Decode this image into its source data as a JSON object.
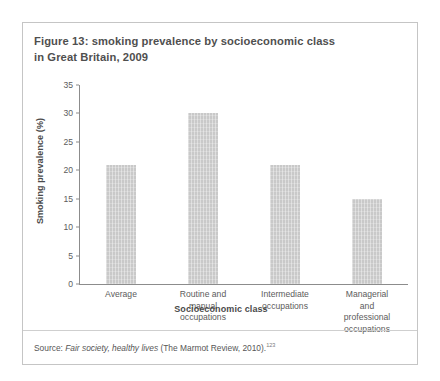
{
  "figure": {
    "title_line1": "Figure 13: smoking prevalence by socioeconomic class",
    "title_line2": "in Great Britain, 2009",
    "source_prefix": "Source: ",
    "source_italic": "Fair society, healthy lives",
    "source_suffix": " (The Marmot Review, 2010).",
    "source_footnote": "123",
    "border_color": "#c5c5c5"
  },
  "chart_data": {
    "type": "bar",
    "title": "Figure 13: smoking prevalence by socioeconomic class in Great Britain, 2009",
    "xlabel": "Socioeconomic class",
    "ylabel": "Smoking prevalence (%)",
    "categories": [
      "Average",
      "Routine and manual occupations",
      "Intermediate occupations",
      "Managerial and professional occupations"
    ],
    "category_lines": [
      [
        "Average"
      ],
      [
        "Routine and",
        "manual",
        "occupations"
      ],
      [
        "Intermediate",
        "occupations"
      ],
      [
        "Managerial",
        "and",
        "professional",
        "occupations"
      ]
    ],
    "values": [
      21,
      30,
      21,
      15
    ],
    "ylim": [
      0,
      35
    ],
    "yticks": [
      0,
      5,
      10,
      15,
      20,
      25,
      30,
      35
    ],
    "ytick_labels": [
      "0",
      "5",
      "10",
      "15",
      "20",
      "25",
      "30",
      "35"
    ],
    "grid": false,
    "legend": false,
    "bar_color": "#c9c9c9",
    "axis_color": "#8c8c8c"
  }
}
